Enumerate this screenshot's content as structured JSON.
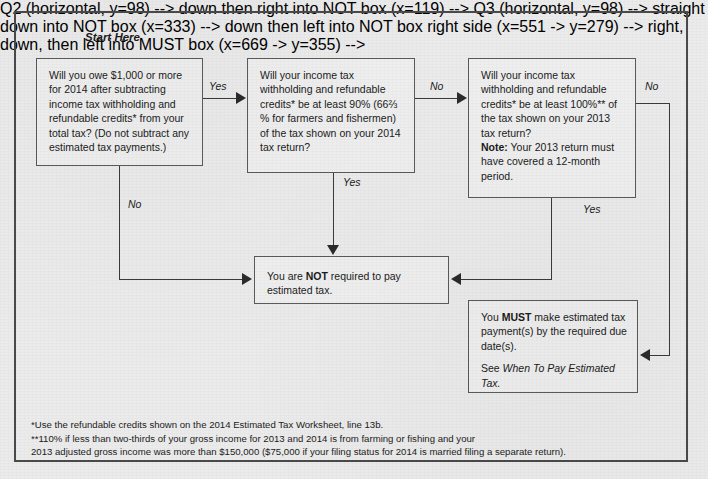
{
  "figure": {
    "start_label": "Start Here"
  },
  "nodes": {
    "q1": {
      "text": "Will you owe $1,000 or more for 2014 after subtracting income tax withholding and refundable credits* from your total tax? (Do not subtract any estimated tax payments.)"
    },
    "q2": {
      "line1": "Will your income tax withholding and refundable credits* be at least 90% (66⅔ % for farmers and fishermen) of the tax shown on your 2014 tax return?"
    },
    "q3": {
      "line1": "Will your income tax withholding and refundable credits* be at least 100%** of the tax shown on your 2013 tax return?",
      "note_label": "Note:",
      "note_text": " Your 2013 return must have covered a 12-month period."
    },
    "not_required": {
      "pre": "You are ",
      "strong": "NOT",
      "post": " required to pay estimated tax."
    },
    "must_pay": {
      "pre": "You ",
      "strong": "MUST",
      "post": " make estimated tax payment(s) by the required due date(s).",
      "see_prefix": "See ",
      "see_italic": "When To Pay Estimated Tax."
    }
  },
  "edges": {
    "yes1": "Yes",
    "no1": "No",
    "no2": "No",
    "yes2": "Yes",
    "no3": "No",
    "yes3": "Yes"
  },
  "footnotes": {
    "line1": "*Use the refundable credits shown on the 2014 Estimated Tax Worksheet, line 13b.",
    "line2": "**110% if less than two-thirds of your gross income for 2013 and 2014 is from farming or fishing and your",
    "line3": "2013 adjusted gross income was more than $150,000 ($75,000 if your filing status for 2014 is married filing a separate return)."
  },
  "colors": {
    "background": "#ebebeb",
    "box_fill": "#efefef",
    "box_border": "#5a5a5a",
    "frame_border": "#4a4a4a",
    "line": "#3a3a3a",
    "text": "#1b1b1b"
  }
}
